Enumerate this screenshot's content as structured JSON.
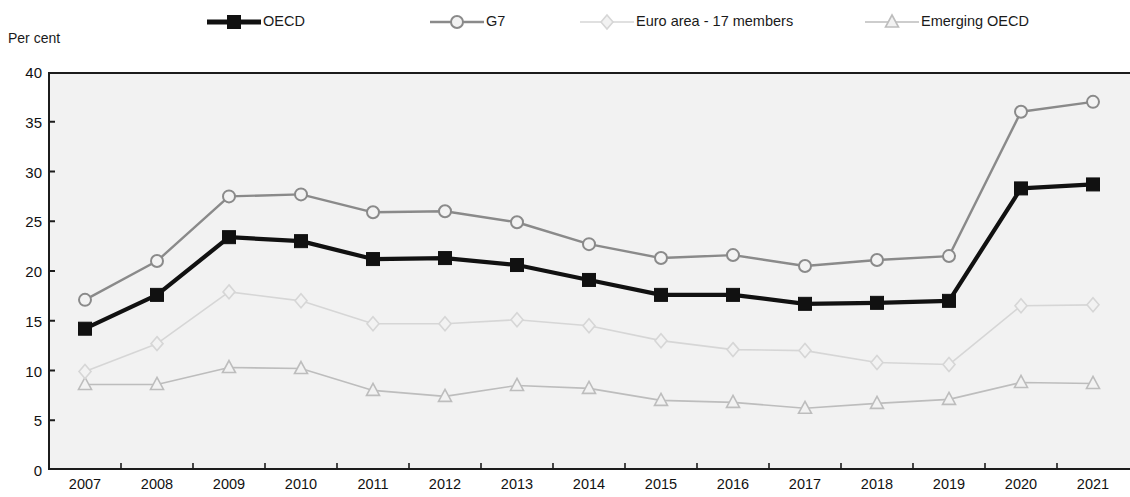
{
  "axis_title": "Per cent",
  "legend": {
    "items": [
      {
        "label": "OECD",
        "key": "oecd",
        "color": "#111111",
        "marker": "square-filled"
      },
      {
        "label": "G7",
        "key": "g7",
        "color": "#8a8a8a",
        "marker": "circle-open"
      },
      {
        "label": "Euro area - 17 members",
        "key": "euro",
        "color": "#d6d6d6",
        "marker": "diamond-open"
      },
      {
        "label": "Emerging OECD",
        "key": "emerging",
        "color": "#bdbdbd",
        "marker": "triangle-open"
      }
    ]
  },
  "chart_data": {
    "type": "line",
    "title": "",
    "xlabel": "",
    "ylabel": "Per cent",
    "ylim": [
      0,
      40
    ],
    "ytick_step": 5,
    "yticks": [
      0,
      5,
      10,
      15,
      20,
      25,
      30,
      35,
      40
    ],
    "grid": false,
    "legend_position": "top",
    "categories": [
      "2007",
      "2008",
      "2009",
      "2010",
      "2011",
      "2012",
      "2013",
      "2014",
      "2015",
      "2016",
      "2017",
      "2018",
      "2019",
      "2020",
      "2021"
    ],
    "series": [
      {
        "name": "OECD",
        "color": "#111111",
        "marker": "square-filled",
        "values": [
          14.2,
          17.6,
          23.4,
          23.0,
          21.2,
          21.3,
          20.6,
          19.1,
          17.6,
          17.6,
          16.7,
          16.8,
          17.0,
          28.3,
          28.7
        ]
      },
      {
        "name": "G7",
        "color": "#8a8a8a",
        "marker": "circle-open",
        "values": [
          17.1,
          21.0,
          27.5,
          27.7,
          25.9,
          26.0,
          24.9,
          22.7,
          21.3,
          21.6,
          20.5,
          21.1,
          21.5,
          36.0,
          37.0
        ]
      },
      {
        "name": "Euro area - 17 members",
        "color": "#d6d6d6",
        "marker": "diamond-open",
        "values": [
          9.9,
          12.7,
          17.9,
          17.0,
          14.7,
          14.7,
          15.1,
          14.5,
          13.0,
          12.1,
          12.0,
          10.8,
          10.6,
          16.5,
          16.6
        ]
      },
      {
        "name": "Emerging OECD",
        "color": "#bdbdbd",
        "marker": "triangle-open",
        "values": [
          8.6,
          8.6,
          10.3,
          10.2,
          8.0,
          7.4,
          8.5,
          8.2,
          7.0,
          6.8,
          6.2,
          6.7,
          7.1,
          8.8,
          8.7
        ]
      }
    ]
  }
}
